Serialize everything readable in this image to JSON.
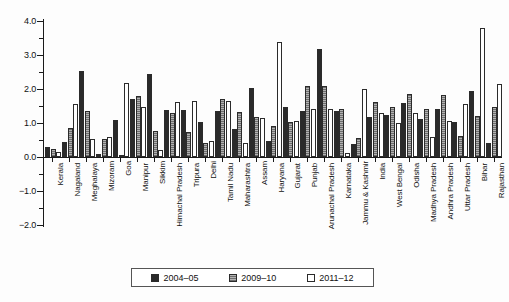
{
  "chart_data": {
    "type": "bar",
    "title": "",
    "xlabel": "",
    "ylabel": "",
    "ylim": [
      -2.0,
      4.0
    ],
    "yticks": [
      "4.0",
      "3.0",
      "2.0",
      "1.0",
      "0.0",
      "-1.0",
      "-2.0"
    ],
    "grid": false,
    "legend_position": "bottom",
    "categories": [
      "Kerala",
      "Nagaland",
      "Meghalaya",
      "Mizoram",
      "Goa",
      "Manipur",
      "Sikkim",
      "Himachal Pradesh",
      "Tripura",
      "Delhi",
      "Tamil Nadu",
      "Maharashtra",
      "Assam",
      "Haryana",
      "Gujarat",
      "Punjab",
      "Arunachal Pradesh",
      "Karnataka",
      "Jammu & Kashmir",
      "India",
      "West Bengal",
      "Odisha",
      "Madhya Pradesh",
      "Andhra Pradesh",
      "Uttar Pradesh",
      "Bihar",
      "Rajasthan"
    ],
    "series": [
      {
        "name": "2004-05",
        "color": "#2a2a2a",
        "values": [
          0.3,
          0.43,
          2.52,
          0.08,
          1.1,
          1.72,
          2.44,
          1.38,
          1.38,
          1.04,
          1.36,
          0.82,
          2.02,
          0.47,
          1.48,
          1.34,
          3.18,
          1.34,
          0.37,
          1.18,
          1.25,
          1.6,
          1.12,
          1.4,
          1.02,
          1.95,
          0.4
        ]
      },
      {
        "name": "2009-10",
        "color": "#8d8d8d",
        "values": [
          0.24,
          0.84,
          1.34,
          0.52,
          0.06,
          1.78,
          0.76,
          1.28,
          0.74,
          0.42,
          1.7,
          1.32,
          1.18,
          0.91,
          1.02,
          2.08,
          2.08,
          1.4,
          0.55,
          1.62,
          1.47,
          1.84,
          1.4,
          1.82,
          0.62,
          1.2,
          1.47
        ]
      },
      {
        "name": "2011-12",
        "color": "#ffffff",
        "values": [
          0.16,
          1.55,
          0.52,
          0.58,
          2.18,
          1.46,
          0.22,
          1.62,
          1.66,
          0.46,
          1.66,
          0.42,
          1.16,
          3.38,
          1.06,
          1.4,
          1.4,
          0.12,
          2.0,
          1.3,
          1.0,
          1.3,
          0.58,
          1.06,
          1.55,
          3.8,
          2.15
        ]
      }
    ]
  },
  "legend": {
    "items": [
      {
        "label": "2004–05",
        "swatch": "dark-filled-square"
      },
      {
        "label": "2009–10",
        "swatch": "hatched-square"
      },
      {
        "label": "2011–12",
        "swatch": "empty-square"
      }
    ]
  },
  "axes": {
    "y_tick_labels": [
      "4.0",
      "3.0",
      "2.0",
      "1.0",
      "0.0",
      "−1.0",
      "−2.0"
    ]
  }
}
